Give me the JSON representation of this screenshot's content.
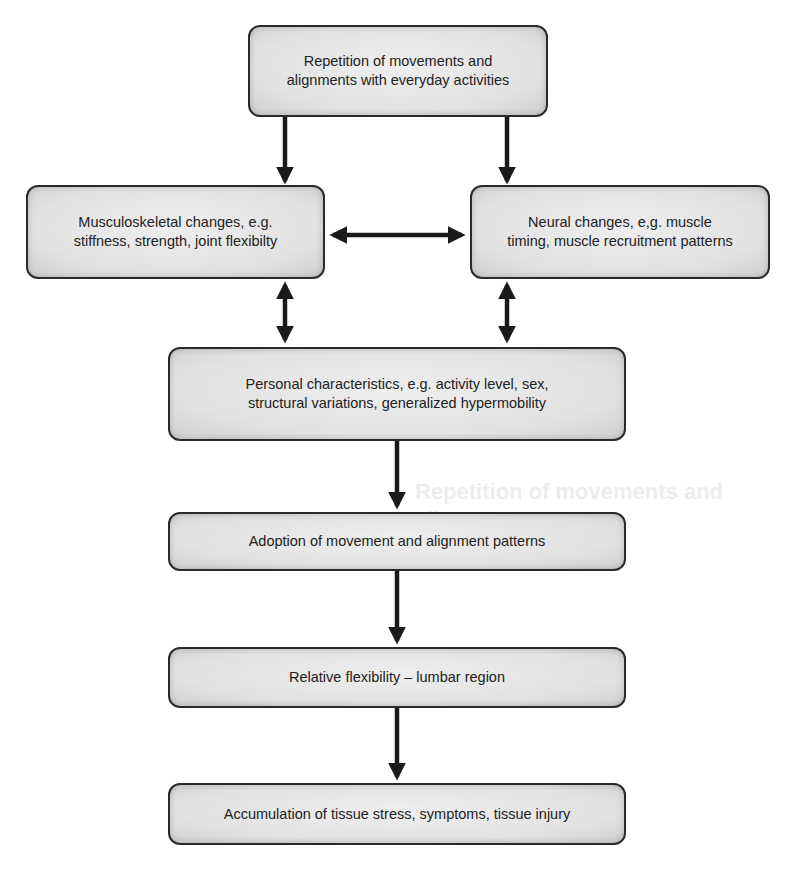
{
  "diagram": {
    "type": "flowchart",
    "nodes": [
      {
        "id": "repetition",
        "text": "Repetition of movements and alignments with everyday activities"
      },
      {
        "id": "musculoskeletal",
        "text": "Musculoskeletal changes, e.g. stiffness, strength, joint flexibilty"
      },
      {
        "id": "neural",
        "text": "Neural changes, e,g. muscle timing, muscle recruitment patterns"
      },
      {
        "id": "personal",
        "text": "Personal characteristics, e.g. activity level, sex, structural variations, generalized hypermobility"
      },
      {
        "id": "adoption",
        "text": "Adoption of movement and alignment patterns"
      },
      {
        "id": "relative",
        "text": "Relative flexibility – lumbar region"
      },
      {
        "id": "accumulation",
        "text": "Accumulation of tissue stress, symptoms, tissue injury"
      }
    ],
    "edges": [
      {
        "from": "repetition",
        "to": "musculoskeletal",
        "direction": "one-way"
      },
      {
        "from": "repetition",
        "to": "neural",
        "direction": "one-way"
      },
      {
        "from": "musculoskeletal",
        "to": "neural",
        "direction": "two-way"
      },
      {
        "from": "musculoskeletal",
        "to": "personal",
        "direction": "two-way"
      },
      {
        "from": "neural",
        "to": "personal",
        "direction": "two-way"
      },
      {
        "from": "personal",
        "to": "adoption",
        "direction": "one-way"
      },
      {
        "from": "adoption",
        "to": "relative",
        "direction": "one-way"
      },
      {
        "from": "relative",
        "to": "accumulation",
        "direction": "one-way"
      }
    ]
  },
  "boxes": {
    "repetition": {
      "line1": "Repetition of movements and",
      "line2": "alignments with everyday activities"
    },
    "musculoskeletal": {
      "line1": "Musculoskeletal changes, e.g.",
      "line2": "stiffness, strength, joint flexibilty"
    },
    "neural": {
      "line1": "Neural changes, e,g. muscle",
      "line2": "timing, muscle recruitment patterns"
    },
    "personal": {
      "line1": "Personal characteristics, e.g. activity level, sex,",
      "line2": "structural variations, generalized hypermobility"
    },
    "adoption": {
      "line1": "Adoption of movement and alignment patterns"
    },
    "relative": {
      "line1": "Relative flexibility – lumbar region"
    },
    "accumulation": {
      "line1": "Accumulation of tissue stress, symptoms, tissue injury"
    }
  },
  "ghost": {
    "heading": "Repetition of movements and alignments"
  },
  "colors": {
    "box_fill": "#e2e2e2",
    "box_border": "#2a2a2a",
    "arrow": "#1a1a1a",
    "text": "#222222",
    "background": "#ffffff"
  }
}
